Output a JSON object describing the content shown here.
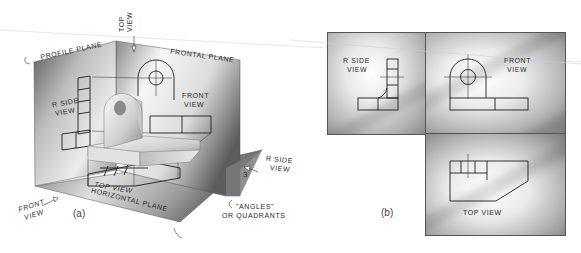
{
  "figure_a": {
    "caption": "(a)",
    "planes": {
      "profile": "PROFILE PLANE",
      "frontal": "FRONTAL PLANE",
      "horizontal": "HORIZONTAL PLANE"
    },
    "view_labels": {
      "top_view_line1": "TOP",
      "top_view_line2": "VIEW",
      "r_side_line1": "R SIDE",
      "r_side_line2": "VIEW",
      "front_line1": "FRONT",
      "front_line2": "VIEW",
      "top_view_proj": "TOP VIEW",
      "arrow_r_side_line1": "R SIDE",
      "arrow_r_side_line2": "VIEW",
      "arrow_front_line1": "FRONT",
      "arrow_front_line2": "VIEW"
    },
    "quadrant_number": "3",
    "angles_note_line1": "\"ANGLES\"",
    "angles_note_line2": "OR QUADRANTS"
  },
  "figure_b": {
    "caption": "(b)",
    "r_side_line1": "R SIDE",
    "r_side_line2": "VIEW",
    "front_line1": "FRONT",
    "front_line2": "VIEW",
    "top_view": "TOP VIEW"
  },
  "colors": {
    "line": "#222222",
    "plane_dark": "#6a6a6a",
    "plane_light": "#f4f4f4"
  }
}
